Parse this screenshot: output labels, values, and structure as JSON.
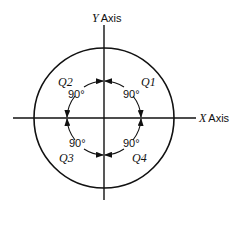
{
  "diagram": {
    "y_axis": {
      "letter": "Y",
      "word": "Axis"
    },
    "x_axis": {
      "letter": "X",
      "word": "Axis"
    },
    "quadrants": [
      {
        "name": "Q1",
        "angle": "90°"
      },
      {
        "name": "Q2",
        "angle": "90°"
      },
      {
        "name": "Q3",
        "angle": "90°"
      },
      {
        "name": "Q4",
        "angle": "90°"
      }
    ],
    "colors": {
      "stroke": "#111111",
      "background": "#ffffff"
    }
  }
}
